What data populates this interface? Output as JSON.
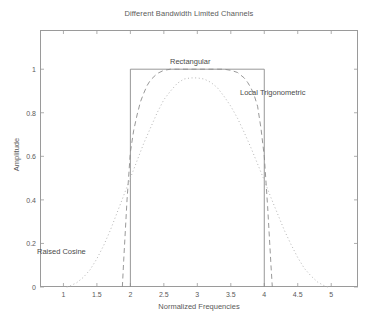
{
  "chart_data": {
    "type": "line",
    "title": "Different Bandwidth Limited Channels",
    "xlabel": "Normalized Frequencies",
    "ylabel": "Amplitude",
    "xlim": [
      0.65,
      5.4
    ],
    "ylim": [
      0,
      1.18
    ],
    "grid": false,
    "legend_position": "inline-annotations",
    "xticks": [
      1,
      1.5,
      2,
      2.5,
      3,
      3.5,
      4,
      4.5,
      5
    ],
    "xticklabels": [
      "1",
      "1.5",
      "2",
      "2.5",
      "3",
      "3.5",
      "4",
      "4.5",
      "5"
    ],
    "yticks": [
      0,
      0.2,
      0.4,
      0.6,
      0.8,
      1
    ],
    "yticklabels": [
      "0",
      "0.2",
      "0.4",
      "0.6",
      "0.8",
      "1"
    ],
    "annotations": [
      {
        "text": "Rectangular",
        "x": 2.75,
        "y": 1.02
      },
      {
        "text": "Local Trigonometric",
        "x": 3.85,
        "y": 0.88
      },
      {
        "text": "Raised Cosine",
        "x": 0.68,
        "y": 0.185
      }
    ],
    "series": [
      {
        "name": "Rectangular",
        "style": "solid",
        "color": "#8c8c8c",
        "x": [
          2,
          2,
          4,
          4
        ],
        "y": [
          0,
          1,
          1,
          0
        ]
      },
      {
        "name": "Local Trigonometric",
        "style": "dashed",
        "color": "#8c8c8c",
        "x": [
          1.88,
          1.9,
          1.95,
          2.0,
          2.05,
          2.1,
          2.15,
          2.2,
          2.25,
          2.3,
          2.4,
          2.5,
          2.6,
          2.7,
          2.8,
          3.0,
          3.2,
          3.3,
          3.4,
          3.5,
          3.6,
          3.7,
          3.75,
          3.8,
          3.85,
          3.9,
          3.95,
          4.0,
          4.05,
          4.1,
          4.12
        ],
        "y": [
          0,
          0.12,
          0.4,
          0.62,
          0.72,
          0.79,
          0.85,
          0.89,
          0.925,
          0.95,
          0.98,
          0.995,
          1.0,
          1.0,
          1.0,
          1.0,
          1.0,
          1.0,
          1.0,
          0.995,
          0.985,
          0.96,
          0.94,
          0.915,
          0.88,
          0.83,
          0.73,
          0.6,
          0.37,
          0.1,
          0
        ]
      },
      {
        "name": "Raised Cosine",
        "style": "dotted",
        "color": "#b5b5b5",
        "x": [
          1.05,
          1.1,
          1.2,
          1.3,
          1.4,
          1.5,
          1.6,
          1.7,
          1.8,
          1.9,
          2.0,
          2.1,
          2.2,
          2.3,
          2.4,
          2.5,
          2.6,
          2.7,
          2.8,
          2.9,
          3.0,
          3.1,
          3.2,
          3.3,
          3.4,
          3.5,
          3.6,
          3.7,
          3.8,
          3.9,
          4.0,
          4.1,
          4.2,
          4.3,
          4.4,
          4.5,
          4.6,
          4.7,
          4.8,
          4.9,
          4.95
        ],
        "y": [
          0,
          0.005,
          0.02,
          0.045,
          0.08,
          0.13,
          0.19,
          0.26,
          0.34,
          0.42,
          0.5,
          0.58,
          0.66,
          0.73,
          0.8,
          0.86,
          0.9,
          0.935,
          0.955,
          0.96,
          0.96,
          0.955,
          0.94,
          0.915,
          0.875,
          0.83,
          0.775,
          0.71,
          0.64,
          0.565,
          0.49,
          0.41,
          0.335,
          0.26,
          0.195,
          0.135,
          0.085,
          0.05,
          0.022,
          0.005,
          0
        ]
      }
    ]
  }
}
